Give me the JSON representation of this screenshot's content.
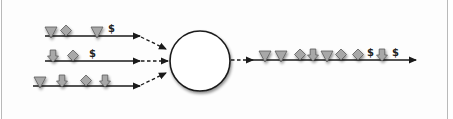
{
  "diagram": {
    "type": "stream-merge",
    "colors": {
      "shape_fill": "#a8a8a8",
      "shape_stroke": "#5a5a5a",
      "line": "#1a1a1a",
      "circle_fill": "#ffffff",
      "border": "#b9b9b9"
    },
    "input_streams": [
      {
        "id": "stream-1",
        "tokens": [
          "triangle",
          "diamond",
          "triangle",
          "$"
        ]
      },
      {
        "id": "stream-2",
        "tokens": [
          "arrow-down",
          "diamond",
          "$"
        ]
      },
      {
        "id": "stream-3",
        "tokens": [
          "triangle",
          "arrow-down",
          "diamond",
          "arrow-down"
        ]
      }
    ],
    "merge_node": {
      "shape": "circle",
      "label": ""
    },
    "output_stream": {
      "tokens": [
        "triangle",
        "triangle",
        "diamond",
        "arrow-down",
        "triangle",
        "diamond",
        "diamond",
        "$",
        "arrow-down",
        "$"
      ]
    },
    "dollar_label": "$"
  }
}
